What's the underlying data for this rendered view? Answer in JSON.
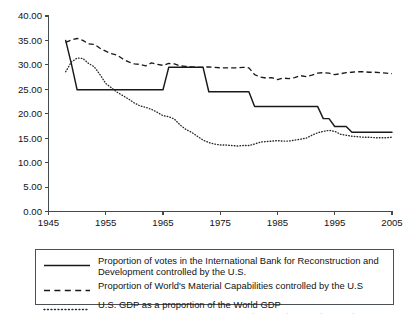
{
  "chart_data": {
    "type": "line",
    "title": "",
    "xlabel": "",
    "ylabel": "",
    "xlim": [
      1945,
      2005
    ],
    "ylim": [
      0.0,
      40.0
    ],
    "grid": false,
    "legend_position": "below-plot",
    "x_ticks": [
      "1945",
      "1955",
      "1965",
      "1975",
      "1985",
      "1995",
      "2005"
    ],
    "x_tick_values": [
      1945,
      1955,
      1965,
      1975,
      1985,
      1995,
      2005
    ],
    "y_ticks": [
      "0.00",
      "5.00",
      "10.00",
      "15.00",
      "20.00",
      "25.00",
      "30.00",
      "35.00",
      "40.00"
    ],
    "y_tick_values": [
      0,
      5,
      10,
      15,
      20,
      25,
      30,
      35,
      40
    ],
    "series": [
      {
        "name": "Proportion of votes in the International Bank for Reconstruction and Development controlled by the U.S.",
        "style": "solid",
        "color": "#17191b",
        "x": [
          1948,
          1949,
          1950,
          1951,
          1952,
          1953,
          1954,
          1955,
          1956,
          1957,
          1958,
          1959,
          1960,
          1961,
          1962,
          1963,
          1964,
          1965,
          1966,
          1967,
          1968,
          1969,
          1970,
          1971,
          1972,
          1973,
          1974,
          1975,
          1976,
          1977,
          1978,
          1979,
          1980,
          1981,
          1982,
          1983,
          1984,
          1985,
          1986,
          1987,
          1988,
          1989,
          1990,
          1991,
          1992,
          1993,
          1994,
          1995,
          1996,
          1997,
          1998,
          1999,
          2000,
          2001,
          2002,
          2003,
          2004,
          2005
        ],
        "y": [
          35.0,
          30.2,
          24.9,
          24.9,
          24.9,
          24.9,
          24.9,
          24.9,
          24.9,
          24.9,
          24.9,
          24.9,
          24.9,
          24.9,
          24.9,
          24.9,
          24.9,
          24.9,
          29.5,
          29.5,
          29.5,
          29.5,
          29.5,
          29.5,
          29.5,
          24.5,
          24.5,
          24.5,
          24.5,
          24.5,
          24.5,
          24.5,
          24.5,
          21.5,
          21.5,
          21.5,
          21.5,
          21.5,
          21.5,
          21.5,
          21.5,
          21.5,
          21.5,
          21.5,
          21.5,
          19.0,
          19.0,
          17.4,
          17.4,
          17.4,
          16.2,
          16.2,
          16.2,
          16.2,
          16.2,
          16.2,
          16.2,
          16.2
        ]
      },
      {
        "name": "Proportion of World's Material Capabilities controlled by the U.S",
        "style": "dashed",
        "color": "#17191b",
        "x": [
          1948,
          1949,
          1950,
          1951,
          1952,
          1953,
          1954,
          1955,
          1956,
          1957,
          1958,
          1959,
          1960,
          1961,
          1962,
          1963,
          1964,
          1965,
          1966,
          1967,
          1968,
          1969,
          1970,
          1971,
          1972,
          1973,
          1974,
          1975,
          1976,
          1977,
          1978,
          1979,
          1980,
          1981,
          1982,
          1983,
          1984,
          1985,
          1986,
          1987,
          1988,
          1989,
          1990,
          1991,
          1992,
          1993,
          1994,
          1995,
          1996,
          1997,
          1998,
          1999,
          2000,
          2001,
          2002,
          2003,
          2004,
          2005
        ],
        "y": [
          34.6,
          35.1,
          35.4,
          35.0,
          34.3,
          34.2,
          33.4,
          32.8,
          32.3,
          32.0,
          31.2,
          30.6,
          30.2,
          30.1,
          29.8,
          30.4,
          30.1,
          29.9,
          30.3,
          30.2,
          29.8,
          29.7,
          29.6,
          29.5,
          29.5,
          29.6,
          29.5,
          29.4,
          29.4,
          29.4,
          29.4,
          29.5,
          29.4,
          28.0,
          27.5,
          27.3,
          27.4,
          27.0,
          27.3,
          27.2,
          27.4,
          27.8,
          27.6,
          27.9,
          28.3,
          28.4,
          28.3,
          28.0,
          28.2,
          28.4,
          28.5,
          28.6,
          28.6,
          28.5,
          28.5,
          28.4,
          28.3,
          28.2
        ]
      },
      {
        "name": "U.S. GDP as a proportion of the World GDP",
        "style": "dotted",
        "color": "#26292b",
        "x": [
          1948,
          1949,
          1950,
          1951,
          1952,
          1953,
          1954,
          1955,
          1956,
          1957,
          1958,
          1959,
          1960,
          1961,
          1962,
          1963,
          1964,
          1965,
          1966,
          1967,
          1968,
          1969,
          1970,
          1971,
          1972,
          1973,
          1974,
          1975,
          1976,
          1977,
          1978,
          1979,
          1980,
          1981,
          1982,
          1983,
          1984,
          1985,
          1986,
          1987,
          1988,
          1989,
          1990,
          1991,
          1992,
          1993,
          1994,
          1995,
          1996,
          1997,
          1998,
          1999,
          2000,
          2001,
          2002,
          2003,
          2004,
          2005
        ],
        "y": [
          28.6,
          30.6,
          31.4,
          31.3,
          30.3,
          29.6,
          28.0,
          26.2,
          25.3,
          24.4,
          23.7,
          23.0,
          22.2,
          21.6,
          21.3,
          20.9,
          20.3,
          19.6,
          19.4,
          18.9,
          17.7,
          16.8,
          16.2,
          15.4,
          14.6,
          14.1,
          13.8,
          13.6,
          13.6,
          13.5,
          13.4,
          13.5,
          13.5,
          13.8,
          14.2,
          14.3,
          14.4,
          14.5,
          14.4,
          14.4,
          14.6,
          14.8,
          15.0,
          15.6,
          16.1,
          16.4,
          16.6,
          16.4,
          15.8,
          15.6,
          15.4,
          15.3,
          15.2,
          15.2,
          15.1,
          15.1,
          15.1,
          15.2
        ]
      }
    ]
  },
  "legend": {
    "entries": [
      {
        "style": "solid",
        "label": "Proportion of votes in the International Bank for Reconstruction and Development controlled by the U.S."
      },
      {
        "style": "dashed",
        "label": "Proportion of World's Material Capabilities controlled by the U.S"
      },
      {
        "style": "dotted",
        "label": "U.S. GDP as a proportion of the World GDP"
      }
    ]
  }
}
